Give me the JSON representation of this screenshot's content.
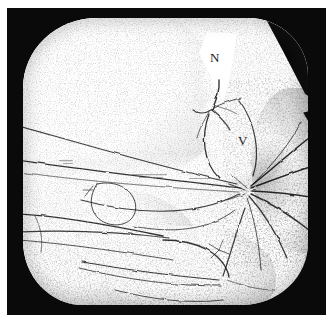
{
  "figure": {
    "medium": "stipple / pen-and-ink halftone",
    "palette": {
      "paper": "#ffffff",
      "frame": "#0a0a0a",
      "ink": "#1a1a1a",
      "stipple": "#555555"
    },
    "aperture": {
      "shape": "rounded-square",
      "field_background": "#ffffff"
    },
    "labels": [
      {
        "id": "n",
        "text": "N",
        "x": 187,
        "y": 33
      },
      {
        "id": "v",
        "text": "V",
        "x": 215,
        "y": 116
      }
    ],
    "regions": [
      {
        "name": "upper-left-lobe"
      },
      {
        "name": "upper-right-lobe"
      },
      {
        "name": "v-lobe"
      },
      {
        "name": "lower-left-lobe"
      },
      {
        "name": "lower-middle-lobe"
      },
      {
        "name": "right-radiating-fan"
      },
      {
        "name": "n-flap"
      },
      {
        "name": "mid-band"
      }
    ]
  }
}
